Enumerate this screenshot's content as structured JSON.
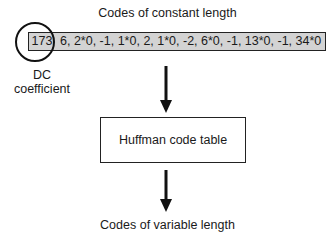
{
  "diagram": {
    "top_label": "Codes of constant length",
    "code_sequence": {
      "dc_value": "173",
      "ac_values": "6, 2*0, -1, 1*0, 2, 1*0, -2, 6*0, -1, 13*0, -1, 34*0",
      "box_color": "#d3d3d3"
    },
    "dc_annotation": {
      "line1": "DC",
      "line2": "coefficient"
    },
    "process_box": {
      "label": "Huffman code table"
    },
    "bottom_label": "Codes of variable length"
  }
}
